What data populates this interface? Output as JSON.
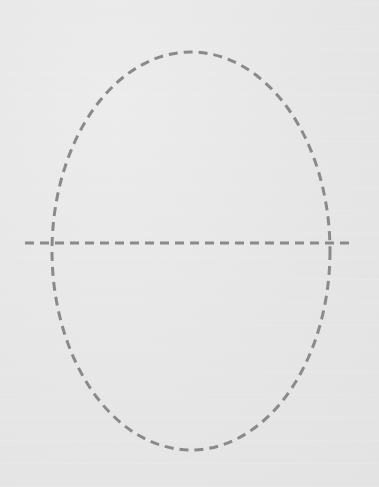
{
  "diagram": {
    "background_color": "#e8e8e8",
    "stroke_color": "#8a8a8a",
    "stroke_width": 3,
    "dash_pattern": "9 6",
    "shapes": [
      {
        "type": "ellipse",
        "name": "dashed-ellipse",
        "cx": 191,
        "cy": 251,
        "rx": 139,
        "ry": 199
      },
      {
        "type": "line",
        "name": "horizontal-dashed-line",
        "x1": 25,
        "y1": 243,
        "x2": 355,
        "y2": 243
      }
    ]
  }
}
